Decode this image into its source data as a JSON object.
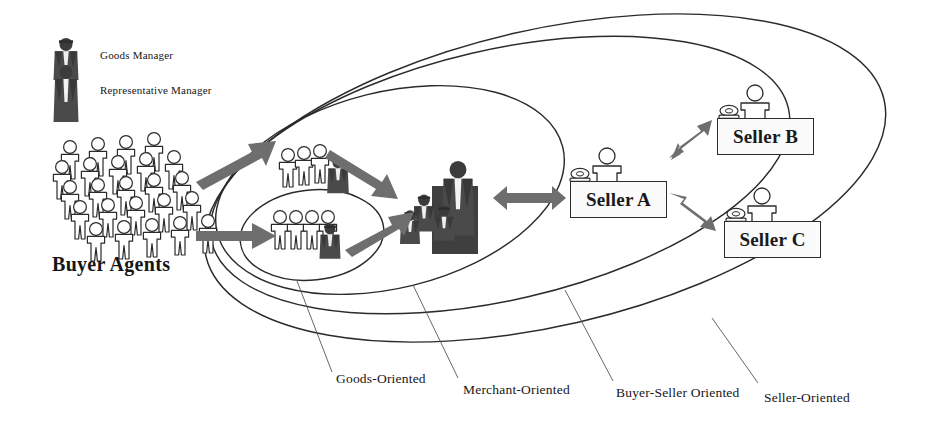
{
  "diagram": {
    "background": "#ffffff",
    "line_color": "#2b2b2b",
    "arrow_color": "#6e6e6e",
    "figure_dark": "#3a3a3a",
    "figure_outline": "#2b2b2b"
  },
  "legend": {
    "items": [
      {
        "label": "Goods Manager",
        "icon": "goods-manager-icon"
      },
      {
        "label": "Representative Manager",
        "icon": "representative-manager-icon"
      }
    ]
  },
  "buyers": {
    "label": "Buyer Agents",
    "rows": 5,
    "per_row": 6
  },
  "scopes": [
    {
      "id": "goods-oriented",
      "label": "Goods-Oriented"
    },
    {
      "id": "merchant-oriented",
      "label": "Merchant-Oriented"
    },
    {
      "id": "buyer-seller-oriented",
      "label": "Buyer-Seller Oriented"
    },
    {
      "id": "seller-oriented",
      "label": "Seller-Oriented"
    }
  ],
  "sellers": [
    {
      "id": "seller-a",
      "label": "Seller A"
    },
    {
      "id": "seller-b",
      "label": "Seller B"
    },
    {
      "id": "seller-c",
      "label": "Seller C"
    }
  ],
  "groups": {
    "upper_group_members": 3,
    "lower_group_members": 4,
    "central_cluster_managers": 4
  }
}
